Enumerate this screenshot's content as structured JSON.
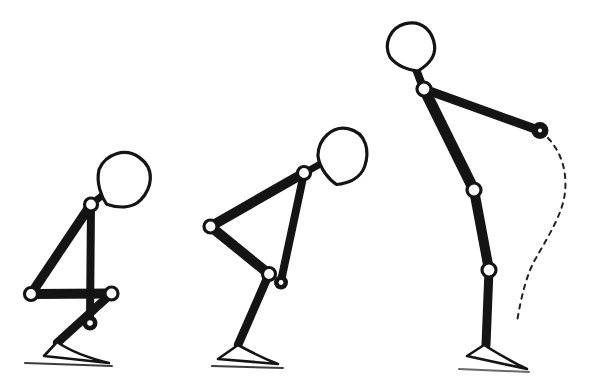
{
  "canvas": {
    "width": 597,
    "height": 392,
    "background": "#ffffff",
    "ink": "#141414"
  },
  "figures": [
    {
      "name": "stick-figure-deep-crouch",
      "head": {
        "cx": 122.5,
        "cy": 180.5,
        "rx": 27.5,
        "ry": 28.5,
        "rotate": 35
      },
      "segments": [
        {
          "name": "torso",
          "x1": 91,
          "y1": 204.5,
          "x2": 31,
          "y2": 294,
          "w": 9.5
        },
        {
          "name": "arm",
          "x1": 91,
          "y1": 204.5,
          "x2": 90,
          "y2": 321,
          "w": 8
        },
        {
          "name": "thigh",
          "x1": 31,
          "y1": 294,
          "x2": 111.5,
          "y2": 293.5,
          "w": 10
        },
        {
          "name": "shin",
          "x1": 111.5,
          "y1": 293.5,
          "x2": 57,
          "y2": 343,
          "w": 8.5
        },
        {
          "name": "neck",
          "x1": 91,
          "y1": 204.5,
          "x2": 109,
          "y2": 190,
          "w": 7
        }
      ],
      "joints": [
        {
          "name": "shoulder-joint",
          "cx": 91,
          "cy": 204.5,
          "r": 6.5
        },
        {
          "name": "hip-joint",
          "cx": 31,
          "cy": 294,
          "r": 6.5
        },
        {
          "name": "knee-joint",
          "cx": 111.5,
          "cy": 293.5,
          "r": 6.5
        }
      ],
      "hand": {
        "cx": 90,
        "cy": 323,
        "r": 7.5,
        "hole": 2.8
      },
      "foot": {
        "apex": [
          57,
          342
        ],
        "heel": [
          44,
          356
        ],
        "toe": [
          109,
          363
        ],
        "q": [
          76,
          355
        ]
      },
      "ground": {
        "x1": 25,
        "y1": 363,
        "x2": 112,
        "y2": 366,
        "color": "#3d3d3d",
        "w": 2
      }
    },
    {
      "name": "stick-figure-mid-rise",
      "head": {
        "cx": 342,
        "cy": 156.5,
        "rx": 25.5,
        "ry": 28.5,
        "rotate": 12
      },
      "segments": [
        {
          "name": "torso",
          "x1": 304,
          "y1": 173,
          "x2": 210.5,
          "y2": 226.5,
          "w": 10
        },
        {
          "name": "arm",
          "x1": 304,
          "y1": 173,
          "x2": 281,
          "y2": 281,
          "w": 8
        },
        {
          "name": "thigh",
          "x1": 210.5,
          "y1": 226.5,
          "x2": 269,
          "y2": 274,
          "w": 10
        },
        {
          "name": "shin",
          "x1": 269,
          "y1": 274,
          "x2": 238,
          "y2": 345,
          "w": 8.5
        },
        {
          "name": "neck",
          "x1": 306,
          "y1": 172,
          "x2": 324,
          "y2": 162,
          "w": 7
        }
      ],
      "joints": [
        {
          "name": "shoulder-joint",
          "cx": 304,
          "cy": 173,
          "r": 6.5
        },
        {
          "name": "hip-joint",
          "cx": 210.5,
          "cy": 226.5,
          "r": 6.5
        },
        {
          "name": "knee-joint",
          "cx": 269,
          "cy": 274,
          "r": 6.5
        }
      ],
      "hand": {
        "cx": 281,
        "cy": 282.5,
        "r": 7,
        "hole": 2.4
      },
      "foot": {
        "apex": [
          238,
          345
        ],
        "heel": [
          218,
          359
        ],
        "toe": [
          278,
          364
        ],
        "q": [
          260,
          357
        ]
      },
      "ground": {
        "x1": 212,
        "y1": 366,
        "x2": 283,
        "y2": 368,
        "color": "#3d3d3d",
        "w": 2
      }
    },
    {
      "name": "stick-figure-upright-armswing",
      "head": {
        "cx": 411,
        "cy": 47.5,
        "rx": 24.5,
        "ry": 24.5,
        "rotate": -15
      },
      "segments": [
        {
          "name": "torso",
          "x1": 424,
          "y1": 89,
          "x2": 474,
          "y2": 190,
          "w": 11
        },
        {
          "name": "arm",
          "x1": 424,
          "y1": 89,
          "x2": 538,
          "y2": 130,
          "w": 9
        },
        {
          "name": "thigh",
          "x1": 474,
          "y1": 190,
          "x2": 489,
          "y2": 270,
          "w": 10
        },
        {
          "name": "shin",
          "x1": 489,
          "y1": 270,
          "x2": 486,
          "y2": 345,
          "w": 9
        },
        {
          "name": "neck",
          "x1": 424,
          "y1": 90,
          "x2": 414,
          "y2": 64,
          "w": 8
        }
      ],
      "joints": [
        {
          "name": "shoulder-joint",
          "cx": 424,
          "cy": 89,
          "r": 7
        },
        {
          "name": "hip-joint",
          "cx": 474,
          "cy": 190,
          "r": 7
        },
        {
          "name": "knee-joint",
          "cx": 489,
          "cy": 270,
          "r": 7
        }
      ],
      "hand": {
        "cx": 540,
        "cy": 130.5,
        "r": 8.5,
        "hole": 2
      },
      "foot": {
        "apex": [
          484,
          345
        ],
        "heel": [
          467,
          356
        ],
        "toe": [
          527,
          369
        ],
        "q": [
          508,
          360
        ]
      },
      "ground": {
        "x1": 459,
        "y1": 369,
        "x2": 529,
        "y2": 372,
        "color": "#6a6a6a",
        "w": 2
      }
    }
  ],
  "hand_swing_path": {
    "d": "M 548 138 C 562 153 567 172 565 192 C 563 213 549 235 536 258 C 527 273 521 297 517 322",
    "dash": "4.5 5.5",
    "width": 2,
    "color": "#222222"
  }
}
